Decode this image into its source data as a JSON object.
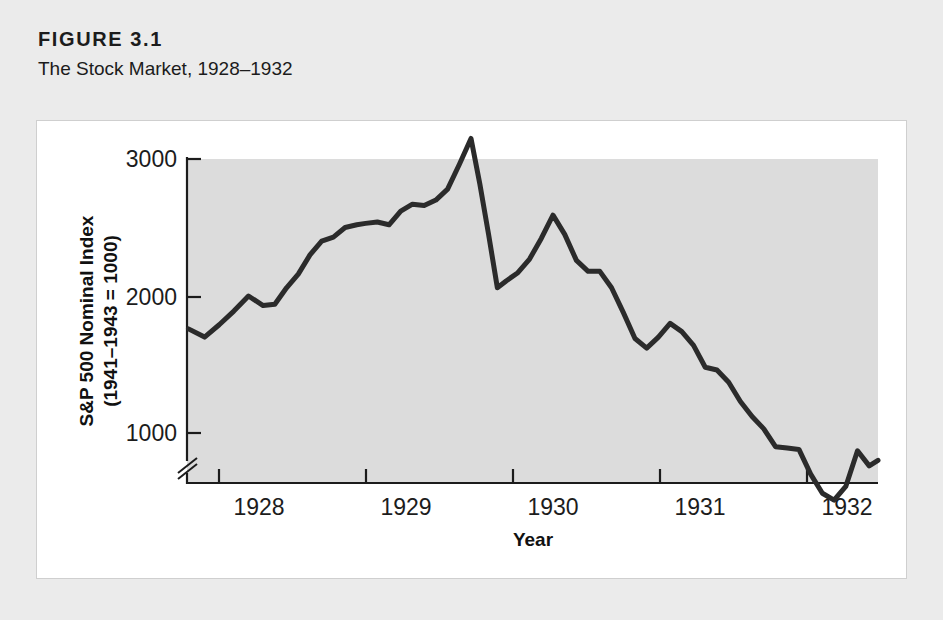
{
  "figure": {
    "number": "FIGURE 3.1",
    "title": "The Stock Market, 1928–1932"
  },
  "colors": {
    "page_background": "#ebebeb",
    "panel_background": "#ffffff",
    "plot_background": "#dcdcdc",
    "line": "#2b2b2b",
    "axis": "#1c1c1c",
    "text": "#1c1c1c"
  },
  "chart_data": {
    "type": "line",
    "title": "The Stock Market, 1928–1932",
    "xlabel": "Year",
    "ylabel": "S&P 500 Nominal Index (1941–1943 = 1000)",
    "ylabel_line1": "S&P 500 Nominal Index",
    "ylabel_line2": "(1941–1943 = 1000)",
    "xtick_labels": [
      "1928",
      "1929",
      "1930",
      "1931",
      "1932"
    ],
    "xticks": [
      1928,
      1929,
      1930,
      1931,
      1932
    ],
    "ytick_labels": [
      "1000",
      "2000",
      "3000"
    ],
    "yticks": [
      1000,
      2000,
      3000
    ],
    "xlim": [
      1927.78,
      1932.5
    ],
    "ylim": [
      430,
      3170
    ],
    "grid": false,
    "legend": false,
    "axis_break": true,
    "axis_break_note": "y-axis broken below 1000",
    "series": [
      {
        "name": "S&P 500 Nominal Index",
        "x": [
          1927.79,
          1927.9,
          1928.0,
          1928.1,
          1928.2,
          1928.3,
          1928.38,
          1928.46,
          1928.54,
          1928.62,
          1928.7,
          1928.78,
          1928.86,
          1928.94,
          1929.0,
          1929.08,
          1929.16,
          1929.24,
          1929.32,
          1929.4,
          1929.48,
          1929.56,
          1929.64,
          1929.72,
          1929.78,
          1929.84,
          1929.9,
          1929.96,
          1930.04,
          1930.12,
          1930.2,
          1930.28,
          1930.36,
          1930.44,
          1930.52,
          1930.6,
          1930.68,
          1930.76,
          1930.84,
          1930.92,
          1931.0,
          1931.08,
          1931.16,
          1931.24,
          1931.32,
          1931.4,
          1931.48,
          1931.56,
          1931.64,
          1931.72,
          1931.8,
          1931.88,
          1931.96,
          1932.04,
          1932.12,
          1932.2,
          1932.28,
          1932.36,
          1932.44,
          1932.5
        ],
        "values": [
          1760,
          1700,
          1790,
          1890,
          2000,
          1930,
          1940,
          2060,
          2160,
          2300,
          2400,
          2430,
          2500,
          2520,
          2530,
          2540,
          2520,
          2620,
          2670,
          2660,
          2700,
          2780,
          2960,
          3150,
          2820,
          2450,
          2060,
          2110,
          2170,
          2270,
          2420,
          2590,
          2450,
          2260,
          2180,
          2180,
          2060,
          1880,
          1690,
          1620,
          1700,
          1800,
          1740,
          1640,
          1480,
          1460,
          1370,
          1230,
          1120,
          1030,
          900,
          890,
          880,
          700,
          560,
          510,
          610,
          870,
          760,
          800
        ]
      }
    ],
    "annotations": [
      {
        "label": "1929 peak",
        "x": 1929.72,
        "y": 3150
      },
      {
        "label": "Crash low",
        "x": 1929.9,
        "y": 2060
      },
      {
        "label": "1930 rebound peak",
        "x": 1930.28,
        "y": 2590
      },
      {
        "label": "1932 trough",
        "x": 1932.2,
        "y": 510
      }
    ]
  },
  "axis_titles": {
    "x": "Year",
    "y_line1": "S&P 500 Nominal Index",
    "y_line2": "(1941–1943 = 1000)"
  }
}
